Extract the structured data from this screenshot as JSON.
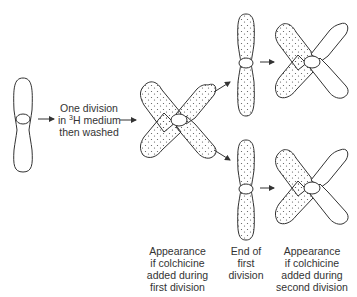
{
  "diagram": {
    "type": "chromosome-labeling-schematic",
    "colors": {
      "outline": "#333333",
      "dots": "#555555",
      "text": "#333333",
      "background": "#ffffff"
    },
    "step_label": {
      "line1": "One division",
      "line2_prefix": "in ",
      "line2_sup": "3",
      "line2_suffix": "H medium",
      "line3": "then washed"
    },
    "captions": {
      "first_division": {
        "line1": "Appearance",
        "line2": "if colchicine",
        "line3": "added during",
        "line4": "first division"
      },
      "end_first": {
        "line1": "End of",
        "line2": "first",
        "line3": "division"
      },
      "second_division": {
        "line1": "Appearance",
        "line2": "if colchicine",
        "line3": "added during",
        "line4": "second division"
      }
    },
    "nodes": [
      {
        "id": "unlabeled-chromosome",
        "shape": "single-chromatid",
        "labeled": "none"
      },
      {
        "id": "first-division-x",
        "shape": "x",
        "labeled": "all-arms"
      },
      {
        "id": "end-first-top",
        "shape": "single-chromatid",
        "labeled": "all"
      },
      {
        "id": "end-first-bottom",
        "shape": "single-chromatid",
        "labeled": "all"
      },
      {
        "id": "second-division-top-x",
        "shape": "x",
        "labeled": "left-arms"
      },
      {
        "id": "second-division-bottom-x",
        "shape": "x",
        "labeled": "left-arms"
      }
    ]
  }
}
